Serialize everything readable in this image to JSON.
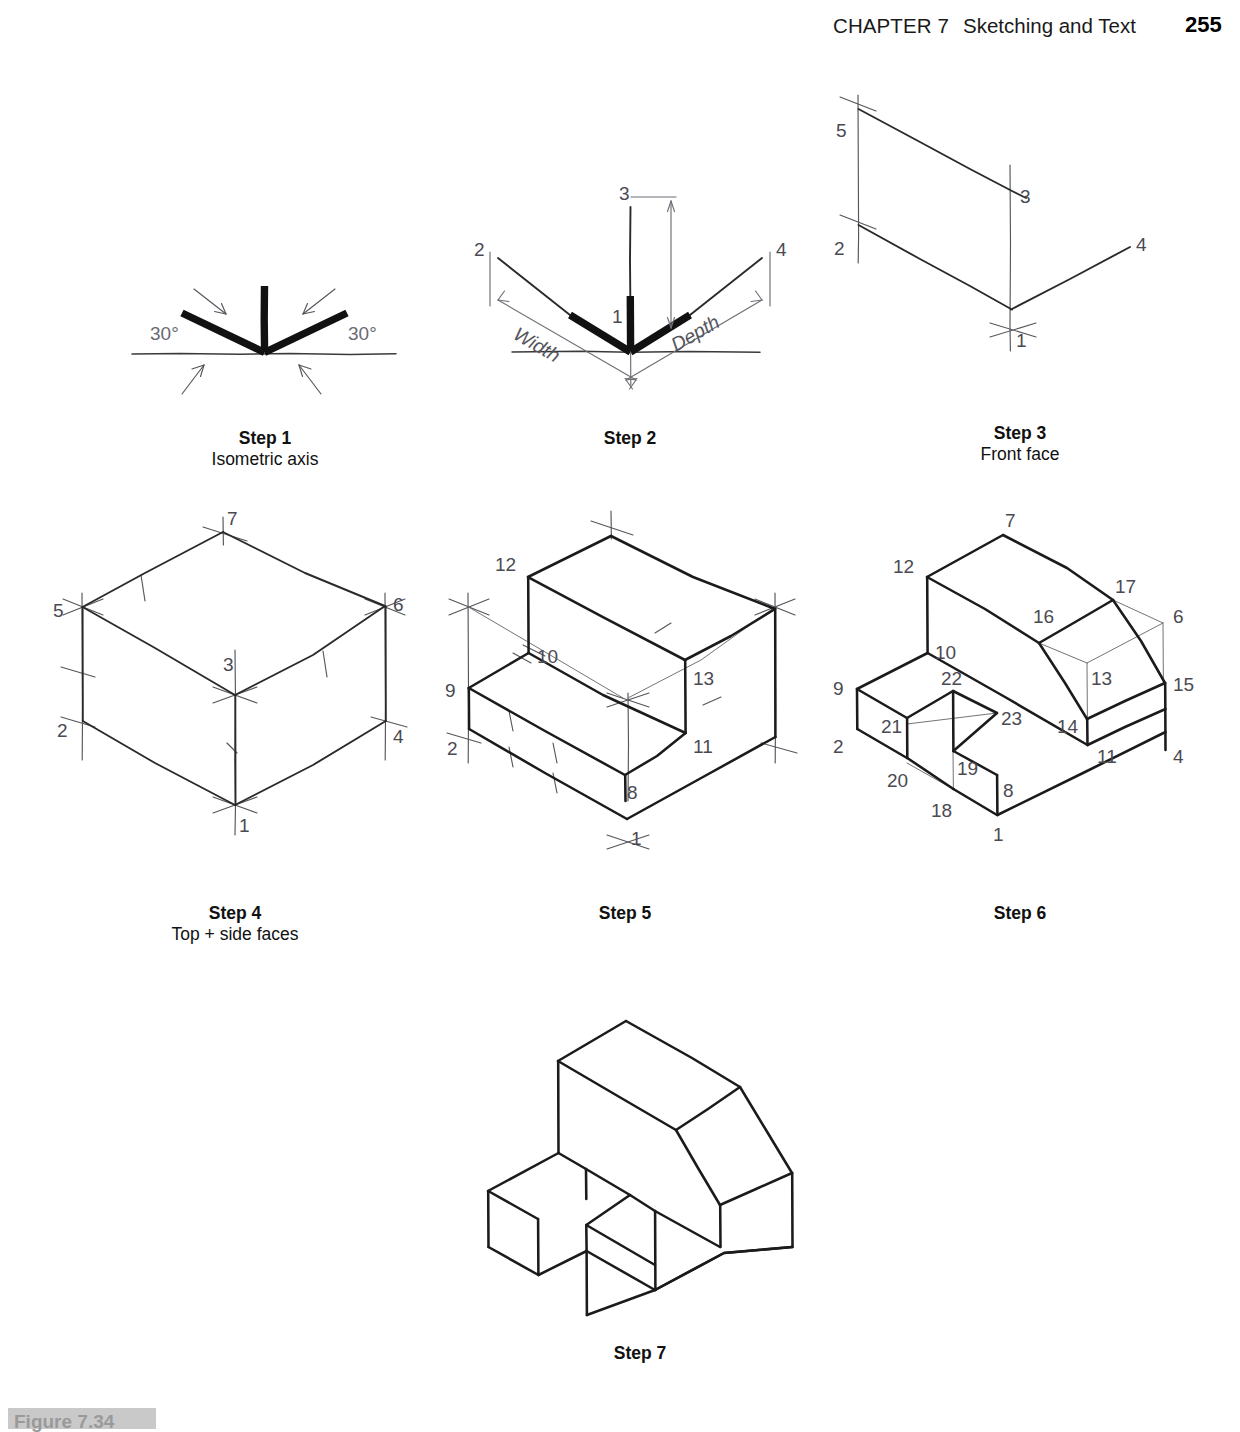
{
  "header": {
    "chapter_label": "CHAPTER 7",
    "chapter_title": "Sketching and Text",
    "page_number": "255"
  },
  "figure_caption": {
    "label": "Figure 7.34"
  },
  "steps": [
    {
      "id": "step1",
      "title": "Step 1",
      "subtitle": "Isometric axis",
      "angle_left": "30°",
      "angle_right": "30°",
      "vertex_labels": []
    },
    {
      "id": "step2",
      "title": "Step 2",
      "subtitle": "",
      "dim_width": "Width",
      "dim_depth": "Depth",
      "vertex_labels": [
        "1",
        "2",
        "3",
        "4"
      ]
    },
    {
      "id": "step3",
      "title": "Step 3",
      "subtitle": "Front face",
      "vertex_labels": [
        "1",
        "2",
        "3",
        "4",
        "5"
      ]
    },
    {
      "id": "step4",
      "title": "Step 4",
      "subtitle": "Top + side faces",
      "vertex_labels": [
        "1",
        "2",
        "3",
        "4",
        "5",
        "6",
        "7"
      ]
    },
    {
      "id": "step5",
      "title": "Step 5",
      "subtitle": "",
      "vertex_labels": [
        "1",
        "2",
        "8",
        "9",
        "10",
        "11",
        "12",
        "13"
      ]
    },
    {
      "id": "step6",
      "title": "Step 6",
      "subtitle": "",
      "vertex_labels": [
        "1",
        "2",
        "4",
        "6",
        "7",
        "8",
        "9",
        "10",
        "11",
        "12",
        "13",
        "14",
        "15",
        "16",
        "17",
        "18",
        "19",
        "20",
        "21",
        "22",
        "23"
      ]
    },
    {
      "id": "step7",
      "title": "Step 7",
      "subtitle": "",
      "vertex_labels": []
    }
  ],
  "s1": {
    "a30l": "30°",
    "a30r": "30°"
  },
  "s2": {
    "v1": "1",
    "v2": "2",
    "v3": "3",
    "v4": "4",
    "width": "Width",
    "depth": "Depth"
  },
  "s3": {
    "v1": "1",
    "v2": "2",
    "v3": "3",
    "v4": "4",
    "v5": "5"
  },
  "s4": {
    "v1": "1",
    "v2": "2",
    "v3": "3",
    "v4": "4",
    "v5": "5",
    "v6": "6",
    "v7": "7"
  },
  "s5": {
    "v1": "1",
    "v2": "2",
    "v8": "8",
    "v9": "9",
    "v10": "10",
    "v11": "11",
    "v12": "12",
    "v13": "13"
  },
  "s6": {
    "v1": "1",
    "v2": "2",
    "v4": "4",
    "v6": "6",
    "v7": "7",
    "v8": "8",
    "v9": "9",
    "v10": "10",
    "v11": "11",
    "v12": "12",
    "v13": "13",
    "v14": "14",
    "v15": "15",
    "v16": "16",
    "v17": "17",
    "v18": "18",
    "v19": "19",
    "v20": "20",
    "v21": "21",
    "v22": "22",
    "v23": "23"
  },
  "captions": {
    "c1t": "Step 1",
    "c1s": "Isometric axis",
    "c2t": "Step 2",
    "c2s": "",
    "c3t": "Step 3",
    "c3s": "Front face",
    "c4t": "Step 4",
    "c4s": "Top + side faces",
    "c5t": "Step 5",
    "c5s": "",
    "c6t": "Step 6",
    "c6s": "",
    "c7t": "Step 7",
    "c7s": ""
  },
  "colors": {
    "ink": "#1b1b1b",
    "label": "#4a4a52",
    "construction": "#6b6b72",
    "page_bg": "#ffffff"
  }
}
